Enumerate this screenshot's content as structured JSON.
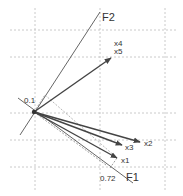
{
  "diagram": {
    "type": "factor-loading-biplot",
    "origin": {
      "x": 34,
      "y": 112
    },
    "grid": {
      "vertical_x": [
        35,
        100,
        165
      ],
      "horizontal_y": [
        30,
        57,
        113,
        140,
        167
      ],
      "color": "#bbbbbb"
    },
    "axes": [
      {
        "id": "F1",
        "label": "F1",
        "from": {
          "x": 18,
          "y": 98
        },
        "to": {
          "x": 133,
          "y": 183
        },
        "label_pos": {
          "x": 126,
          "y": 181
        }
      },
      {
        "id": "F2",
        "label": "F2",
        "from": {
          "x": 20,
          "y": 135
        },
        "to": {
          "x": 100,
          "y": 12
        },
        "label_pos": {
          "x": 102,
          "y": 21
        }
      }
    ],
    "vectors": [
      {
        "id": "x4x5",
        "labels": [
          "x4",
          "x5"
        ],
        "to": {
          "x": 111,
          "y": 58
        },
        "label_pos": {
          "x": 114,
          "y": 44
        }
      },
      {
        "id": "x2",
        "labels": [
          "x2"
        ],
        "to": {
          "x": 140,
          "y": 142
        },
        "label_pos": {
          "x": 144,
          "y": 145
        }
      },
      {
        "id": "x3",
        "labels": [
          "x3"
        ],
        "to": {
          "x": 122,
          "y": 145
        },
        "label_pos": {
          "x": 125,
          "y": 149
        }
      },
      {
        "id": "x1",
        "labels": [
          "x1"
        ],
        "to": {
          "x": 117,
          "y": 158
        },
        "label_pos": {
          "x": 121,
          "y": 162
        }
      }
    ],
    "annotations": [
      {
        "id": "loading-f2",
        "text": "0.1",
        "pos": {
          "x": 24,
          "y": 102
        }
      },
      {
        "id": "loading-f1",
        "text": "0.72",
        "pos": {
          "x": 100,
          "y": 180
        }
      }
    ],
    "colors": {
      "axis_line": "#555555",
      "vector": "#444444",
      "dashed": "#666666",
      "text": "#333333"
    }
  },
  "labels": {
    "f1": "F1",
    "f2": "F2",
    "x1": "x1",
    "x2": "x2",
    "x3": "x3",
    "x4": "x4",
    "x5": "x5",
    "val_01": "0.1",
    "val_072": "0.72"
  }
}
